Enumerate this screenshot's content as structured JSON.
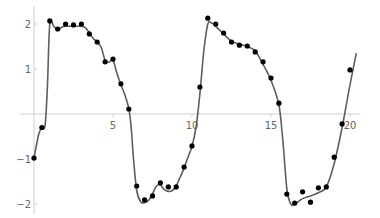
{
  "chart_data": {
    "type": "scatter",
    "title": "",
    "xlabel": "",
    "ylabel": "",
    "xlim": [
      0,
      20.4
    ],
    "ylim": [
      -2.15,
      2.35
    ],
    "grid": false,
    "legend": null,
    "x_ticks": [
      5,
      10,
      15,
      20
    ],
    "x_tick_labels": [
      "5",
      "10",
      "15",
      "20"
    ],
    "y_ticks": [
      -2,
      -1,
      1,
      2
    ],
    "y_tick_labels": [
      "−2",
      "−1",
      "1",
      "2"
    ],
    "colors": {
      "points": "#000000",
      "curve": "#5e5e5e",
      "axes": "#cfcfcf",
      "tick_labels": "#666666"
    },
    "series": [
      {
        "name": "data points",
        "kind": "scatter",
        "x": [
          0,
          0.5,
          1,
          1.5,
          2,
          2.5,
          3,
          3.5,
          4,
          4.5,
          5,
          5.5,
          6,
          6.5,
          7,
          7.5,
          8,
          8.5,
          9,
          9.5,
          10,
          10.5,
          11,
          11.5,
          12,
          12.5,
          13,
          13.5,
          14,
          14.5,
          15,
          15.5,
          16,
          16.5,
          17,
          17.5,
          18,
          18.5,
          19,
          19.5,
          20
        ],
        "y": [
          -0.98,
          -0.3,
          2.07,
          1.89,
          2.0,
          1.98,
          2.0,
          1.78,
          1.6,
          1.16,
          1.22,
          0.67,
          0.11,
          -1.6,
          -1.91,
          -1.82,
          -1.53,
          -1.62,
          -1.62,
          -1.18,
          -0.71,
          0.6,
          2.13,
          2.0,
          1.8,
          1.6,
          1.53,
          1.51,
          1.38,
          1.16,
          0.8,
          0.24,
          -1.78,
          -1.98,
          -1.73,
          -1.96,
          -1.64,
          -1.62,
          -0.96,
          -0.22,
          0.98
        ]
      },
      {
        "name": "fitted curve",
        "kind": "line",
        "x": [
          0,
          0.3,
          0.5,
          0.7,
          0.85,
          1.0,
          1.25,
          1.5,
          1.75,
          2.0,
          2.5,
          3.0,
          3.25,
          3.5,
          3.75,
          4.0,
          4.25,
          4.5,
          4.75,
          5.0,
          5.25,
          5.5,
          5.75,
          6.0,
          6.15,
          6.3,
          6.5,
          6.75,
          7.0,
          7.25,
          7.5,
          7.75,
          8.0,
          8.25,
          8.5,
          8.75,
          9.0,
          9.25,
          9.5,
          9.75,
          10.0,
          10.25,
          10.5,
          10.75,
          11.0,
          11.25,
          11.5,
          12.0,
          12.5,
          13.0,
          13.5,
          14.0,
          14.5,
          15.0,
          15.5,
          15.75,
          16.0,
          16.25,
          16.5,
          17.0,
          17.5,
          18.0,
          18.5,
          19.0,
          19.5,
          20.0,
          20.4
        ],
        "y": [
          -0.98,
          -0.45,
          -0.3,
          -0.25,
          0.6,
          2.0,
          1.95,
          1.87,
          1.93,
          1.95,
          1.95,
          1.95,
          1.92,
          1.8,
          1.68,
          1.6,
          1.48,
          1.2,
          1.15,
          1.2,
          0.9,
          0.65,
          0.42,
          0.12,
          -0.3,
          -1.0,
          -1.7,
          -1.95,
          -1.97,
          -1.92,
          -1.78,
          -1.6,
          -1.58,
          -1.68,
          -1.72,
          -1.7,
          -1.6,
          -1.4,
          -1.2,
          -0.95,
          -0.72,
          -0.3,
          0.45,
          1.4,
          2.0,
          2.02,
          1.95,
          1.78,
          1.62,
          1.55,
          1.5,
          1.4,
          1.1,
          0.75,
          0.2,
          -0.6,
          -1.65,
          -2.0,
          -2.0,
          -1.88,
          -1.82,
          -1.75,
          -1.62,
          -1.1,
          -0.3,
          0.65,
          1.35
        ]
      }
    ]
  }
}
